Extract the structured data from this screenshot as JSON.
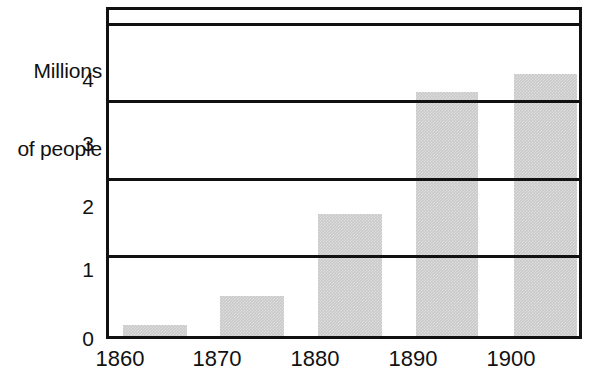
{
  "chart_data": {
    "type": "bar",
    "title": "",
    "subtitle": "",
    "xlabel": "",
    "ylabel": "Millions of people",
    "ylabel_lines": [
      "Millions",
      "of people"
    ],
    "categories": [
      "1860",
      "1870",
      "1880",
      "1890",
      "1900"
    ],
    "values": [
      0.14,
      0.52,
      1.57,
      3.15,
      3.38
    ],
    "series": [
      {
        "name": "Population",
        "values": [
          0.14,
          0.52,
          1.57,
          3.15,
          3.38
        ]
      }
    ],
    "ylim": [
      0,
      4.2
    ],
    "ytick_labels": [
      "0",
      "1",
      "2",
      "3",
      "4"
    ],
    "ytick_values": [
      0,
      1,
      2,
      3,
      4
    ],
    "xtick_labels": [
      "1860",
      "1870",
      "1880",
      "1890",
      "1900"
    ],
    "grid": true,
    "grid_axis": "y",
    "legend": false,
    "legend_position": "none",
    "bar_color": "#c9c9c9",
    "axis_color": "#111111",
    "background_color": "#ffffff",
    "annotations": []
  }
}
